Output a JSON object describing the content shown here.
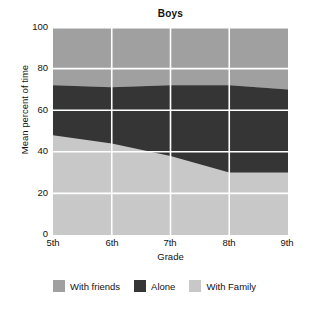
{
  "chart_data": {
    "type": "area",
    "title": "Boys",
    "xlabel": "Grade",
    "ylabel": "Mean percent of time",
    "categories": [
      "5th",
      "6th",
      "7th",
      "8th",
      "9th"
    ],
    "x_tick_labels": [
      "5th",
      "6th",
      "7th",
      "8th",
      "9th"
    ],
    "y_tick_labels": [
      "0",
      "20",
      "40",
      "60",
      "80",
      "100"
    ],
    "y_ticks": [
      0,
      20,
      40,
      60,
      80,
      100
    ],
    "ylim": [
      0,
      100
    ],
    "grid": true,
    "stacked": true,
    "legend_position": "bottom",
    "series": [
      {
        "name": "With Family",
        "color": "#c8c8c8",
        "values": [
          48,
          44,
          38,
          30,
          30
        ]
      },
      {
        "name": "Alone",
        "color": "#353535",
        "values": [
          24,
          27,
          34,
          42,
          40
        ]
      },
      {
        "name": "With friends",
        "color": "#a0a0a0",
        "values": [
          28,
          29,
          28,
          28,
          30
        ]
      }
    ],
    "cumulative_boundaries": {
      "family_top": [
        48,
        44,
        38,
        30,
        30
      ],
      "alone_top": [
        72,
        71,
        72,
        72,
        70
      ],
      "friends_top": [
        100,
        100,
        100,
        100,
        100
      ]
    },
    "legend": [
      {
        "label": "With friends",
        "color": "#a0a0a0"
      },
      {
        "label": "Alone",
        "color": "#353535"
      },
      {
        "label": "With Family",
        "color": "#c8c8c8"
      }
    ],
    "gridline_color": "#ffffff",
    "background_color": "#ffffff"
  }
}
